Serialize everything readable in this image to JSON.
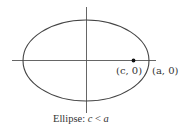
{
  "diagram": {
    "type": "ellipse",
    "caption": "Ellipse: c < a",
    "caption_parts": {
      "prefix": "Ellipse: ",
      "c": "c",
      "op": " < ",
      "a": "a"
    },
    "labels": {
      "focus": "(c, 0)",
      "vertex": "(a, 0)"
    },
    "colors": {
      "stroke": "#444444",
      "text": "#333333",
      "background": "#ffffff"
    }
  }
}
